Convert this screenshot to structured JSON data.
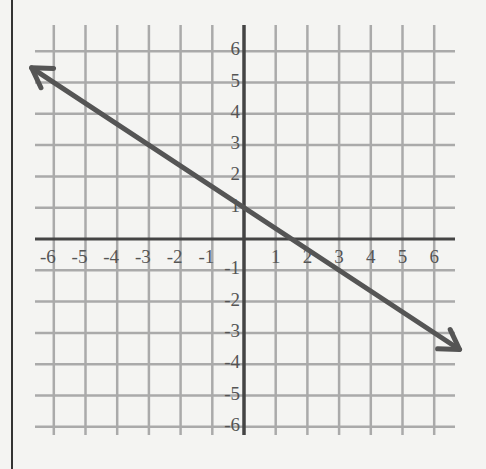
{
  "chart_data": {
    "type": "line",
    "title": "",
    "xlabel": "",
    "ylabel": "",
    "xlim": [
      -6,
      6
    ],
    "ylim": [
      -6,
      6
    ],
    "grid": true,
    "x_ticks": [
      -6,
      -5,
      -4,
      -3,
      -2,
      -1,
      1,
      2,
      3,
      4,
      5,
      6
    ],
    "y_ticks": [
      6,
      5,
      4,
      3,
      2,
      1,
      -1,
      -2,
      -3,
      -4,
      -5,
      -6
    ],
    "x_tick_labels": [
      "-6",
      "-5",
      "-4",
      "-3",
      "-2",
      "-1",
      "1",
      "2",
      "3",
      "4",
      "5",
      "6"
    ],
    "y_tick_labels": [
      "6",
      "5",
      "4",
      "3",
      "2",
      "1",
      "-1",
      "-2",
      "-3",
      "-4",
      "-5",
      "-6"
    ],
    "series": [
      {
        "name": "line",
        "equation": "y = -2/3 x + 1",
        "slope": -0.6667,
        "intercept": 1,
        "arrows": "both",
        "x": [
          -6.7,
          -6,
          -3,
          0,
          1.5,
          3,
          6,
          6.8
        ],
        "y": [
          5.47,
          5,
          3,
          1,
          0,
          -1,
          -3,
          -3.53
        ]
      }
    ],
    "colors": {
      "line": "#555555",
      "grid": "#aaaaaa",
      "axis": "#444444"
    }
  }
}
